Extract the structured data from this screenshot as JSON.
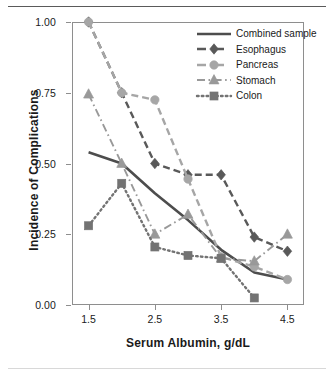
{
  "chart_data": {
    "type": "line",
    "title": "",
    "xlabel": "Serum Albumin, g/dL",
    "ylabel": "Incidence of Complications",
    "x": [
      1.5,
      2.0,
      2.5,
      3.0,
      3.5,
      4.0,
      4.5
    ],
    "xlim": [
      1.25,
      4.75
    ],
    "ylim": [
      0.0,
      1.0
    ],
    "xticks": [
      1.5,
      2.5,
      3.5,
      4.5
    ],
    "xticklabels": [
      "1.5",
      "2.5",
      "3.5",
      "4.5"
    ],
    "yticks": [
      0.0,
      0.25,
      0.5,
      0.75,
      1.0
    ],
    "yticklabels": [
      "0.00",
      "0.25",
      "0.50",
      "0.75",
      "1.00"
    ],
    "grid": false,
    "legend_position": "top-right",
    "series": [
      {
        "name": "Combined sample",
        "color": "#4d4d4d",
        "linestyle": "solid",
        "marker": "none",
        "x": [
          1.5,
          2.0,
          2.5,
          3.0,
          3.5,
          4.0,
          4.5
        ],
        "values": [
          0.54,
          0.5,
          0.395,
          0.3,
          0.195,
          0.115,
          0.09
        ]
      },
      {
        "name": "Esophagus",
        "color": "#595959",
        "linestyle": "dashed",
        "marker": "diamond",
        "x": [
          1.5,
          2.0,
          2.5,
          3.0,
          3.5,
          4.0,
          4.5
        ],
        "values": [
          1.0,
          0.75,
          0.5,
          0.46,
          0.46,
          0.24,
          0.19
        ]
      },
      {
        "name": "Pancreas",
        "color": "#a6a6a6",
        "linestyle": "dashed",
        "marker": "circle",
        "x": [
          1.5,
          2.0,
          2.5,
          3.0,
          3.5,
          4.0,
          4.5
        ],
        "values": [
          1.0,
          0.75,
          0.725,
          0.445,
          0.17,
          0.135,
          0.09
        ]
      },
      {
        "name": "Stomach",
        "color": "#999999",
        "linestyle": "dashdot",
        "marker": "triangle",
        "x": [
          1.5,
          2.0,
          2.5,
          3.0,
          3.5,
          4.0,
          4.5
        ],
        "values": [
          0.745,
          0.5,
          0.25,
          0.32,
          0.165,
          0.155,
          0.25
        ]
      },
      {
        "name": "Colon",
        "color": "#737373",
        "linestyle": "dotted",
        "marker": "square",
        "x": [
          1.5,
          2.0,
          2.5,
          3.0,
          3.5,
          4.0
        ],
        "values": [
          0.28,
          0.43,
          0.205,
          0.175,
          0.165,
          0.025
        ]
      }
    ]
  },
  "legend": {
    "items": [
      {
        "label": "Combined sample"
      },
      {
        "label": "Esophagus"
      },
      {
        "label": "Pancreas"
      },
      {
        "label": "Stomach"
      },
      {
        "label": "Colon"
      }
    ]
  }
}
